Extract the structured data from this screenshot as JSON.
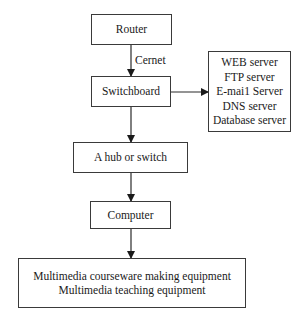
{
  "diagram": {
    "type": "flowchart",
    "nodes": {
      "router": {
        "label": "Router"
      },
      "switchboard": {
        "label": "Switchboard"
      },
      "servers": {
        "lines": [
          "WEB server",
          "FTP server",
          "E-mai1 Server",
          "DNS server",
          "Database server"
        ]
      },
      "hub": {
        "label": "A hub or switch"
      },
      "computer": {
        "label": "Computer"
      },
      "equipment": {
        "lines": [
          "Multimedia courseware making equipment",
          "Multimedia teaching equipment"
        ]
      }
    },
    "edges": [
      {
        "from": "Router",
        "to": "Switchboard",
        "label": "Cernet"
      },
      {
        "from": "Switchboard",
        "to": "Servers",
        "label": ""
      },
      {
        "from": "Switchboard",
        "to": "A hub or switch",
        "label": ""
      },
      {
        "from": "A hub or switch",
        "to": "Computer",
        "label": ""
      },
      {
        "from": "Computer",
        "to": "Multimedia equipment",
        "label": ""
      }
    ],
    "edge_labels": {
      "cernet": "Cernet"
    },
    "colors": {
      "stroke": "#3a3a3a",
      "text": "#1a1a1a",
      "background": "#ffffff"
    }
  }
}
